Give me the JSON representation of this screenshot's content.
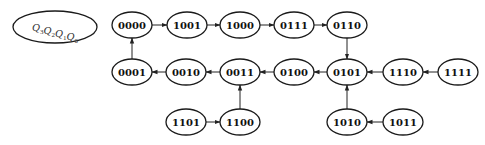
{
  "diagram": {
    "type": "state-transition",
    "legend": {
      "label_parts": [
        {
          "base": "Q",
          "sub": "3"
        },
        {
          "base": "Q",
          "sub": "2"
        },
        {
          "base": "Q",
          "sub": "1"
        },
        {
          "base": "Q",
          "sub": "0"
        }
      ],
      "text": "Q3Q2Q1Q0",
      "cx": 55,
      "cy": 27,
      "rx": 42,
      "ry": 16
    },
    "node_size": {
      "rx": 20,
      "ry": 13
    },
    "nodes": [
      {
        "id": "0000",
        "label": "0000",
        "cx": 132,
        "cy": 25
      },
      {
        "id": "1001",
        "label": "1001",
        "cx": 187,
        "cy": 25
      },
      {
        "id": "1000",
        "label": "1000",
        "cx": 240,
        "cy": 25
      },
      {
        "id": "0111",
        "label": "0111",
        "cx": 294,
        "cy": 25
      },
      {
        "id": "0110",
        "label": "0110",
        "cx": 347,
        "cy": 25
      },
      {
        "id": "0001",
        "label": "0001",
        "cx": 132,
        "cy": 72
      },
      {
        "id": "0010",
        "label": "0010",
        "cx": 186,
        "cy": 72
      },
      {
        "id": "0011",
        "label": "0011",
        "cx": 240,
        "cy": 72
      },
      {
        "id": "0100",
        "label": "0100",
        "cx": 294,
        "cy": 72
      },
      {
        "id": "0101",
        "label": "0101",
        "cx": 347,
        "cy": 72
      },
      {
        "id": "1110",
        "label": "1110",
        "cx": 403,
        "cy": 72
      },
      {
        "id": "1111",
        "label": "1111",
        "cx": 458,
        "cy": 72
      },
      {
        "id": "1101",
        "label": "1101",
        "cx": 186,
        "cy": 122
      },
      {
        "id": "1100",
        "label": "1100",
        "cx": 240,
        "cy": 122
      },
      {
        "id": "1010",
        "label": "1010",
        "cx": 347,
        "cy": 122
      },
      {
        "id": "1011",
        "label": "1011",
        "cx": 403,
        "cy": 122
      }
    ],
    "edges": [
      {
        "from": "0000",
        "to": "1001"
      },
      {
        "from": "1001",
        "to": "1000"
      },
      {
        "from": "1000",
        "to": "0111"
      },
      {
        "from": "0111",
        "to": "0110"
      },
      {
        "from": "0110",
        "to": "0101"
      },
      {
        "from": "0101",
        "to": "0100"
      },
      {
        "from": "0100",
        "to": "0011"
      },
      {
        "from": "0011",
        "to": "0010"
      },
      {
        "from": "0010",
        "to": "0001"
      },
      {
        "from": "0001",
        "to": "0000"
      },
      {
        "from": "1111",
        "to": "1110"
      },
      {
        "from": "1110",
        "to": "0101"
      },
      {
        "from": "1011",
        "to": "1010"
      },
      {
        "from": "1010",
        "to": "0101"
      },
      {
        "from": "1101",
        "to": "1100"
      },
      {
        "from": "1100",
        "to": "0011"
      }
    ],
    "colors": {
      "stroke": "#1a1a1a",
      "text": "#111111",
      "background": "#ffffff"
    }
  }
}
